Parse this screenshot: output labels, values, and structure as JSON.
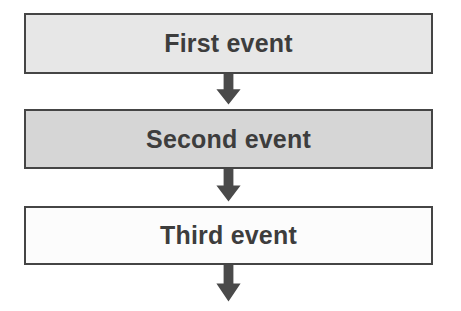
{
  "diagram": {
    "type": "flowchart",
    "orientation": "vertical",
    "title": "",
    "background_color": "#ffffff",
    "nodes": [
      {
        "id": "node-1",
        "label": "First event",
        "shape": "rectangle",
        "fill_color": "#e7e7e7",
        "border_color": "#454545",
        "text_color": "#3d3d3d"
      },
      {
        "id": "node-2",
        "label": "Second event",
        "shape": "rectangle",
        "fill_color": "#d6d6d6",
        "border_color": "#454545",
        "text_color": "#3d3d3d"
      },
      {
        "id": "node-3",
        "label": "Third event",
        "shape": "rectangle",
        "fill_color": "#fcfcfc",
        "border_color": "#454545",
        "text_color": "#3d3d3d"
      }
    ],
    "connectors": [
      {
        "id": "arrow-1",
        "from": "node-1",
        "to": "node-2",
        "direction": "down",
        "label": "",
        "color": "#4a4a4a"
      },
      {
        "id": "arrow-2",
        "from": "node-2",
        "to": "node-3",
        "direction": "down",
        "label": "",
        "color": "#4a4a4a"
      },
      {
        "id": "arrow-3",
        "from": "node-3",
        "to": "",
        "direction": "down",
        "label": "",
        "color": "#4a4a4a"
      }
    ]
  }
}
